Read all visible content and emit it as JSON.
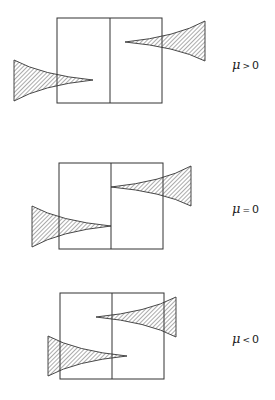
{
  "figure": {
    "panels": [
      {
        "label": {
          "symbol": "μ",
          "operator": ">",
          "value": "0"
        },
        "box": {
          "x": 57,
          "y": 18,
          "w": 105,
          "h": 85,
          "divider_x": 110
        },
        "left_wedge": {
          "base_x": 14,
          "base_top": 60,
          "base_bottom": 101,
          "tip_x": 93,
          "tip_y": 80
        },
        "right_wedge": {
          "base_x": 205,
          "base_top": 21,
          "base_bottom": 61,
          "tip_x": 125,
          "tip_y": 42
        }
      },
      {
        "label": {
          "symbol": "μ",
          "operator": "=",
          "value": "0"
        },
        "box": {
          "x": 59,
          "y": 163,
          "w": 104,
          "h": 86,
          "divider_x": 111
        },
        "left_wedge": {
          "base_x": 32,
          "base_top": 206,
          "base_bottom": 247,
          "tip_x": 111,
          "tip_y": 226
        },
        "right_wedge": {
          "base_x": 191,
          "base_top": 166,
          "base_bottom": 206,
          "tip_x": 111,
          "tip_y": 187
        }
      },
      {
        "label": {
          "symbol": "μ",
          "operator": "<",
          "value": "0"
        },
        "box": {
          "x": 60,
          "y": 293,
          "w": 104,
          "h": 86,
          "divider_x": 112
        },
        "left_wedge": {
          "base_x": 48,
          "base_top": 336,
          "base_bottom": 376,
          "tip_x": 127,
          "tip_y": 356
        },
        "right_wedge": {
          "base_x": 176,
          "base_top": 297,
          "base_bottom": 337,
          "tip_x": 96,
          "tip_y": 317
        }
      }
    ],
    "colors": {
      "line": "#333333",
      "hatch": "#444444",
      "background": "#ffffff"
    }
  }
}
